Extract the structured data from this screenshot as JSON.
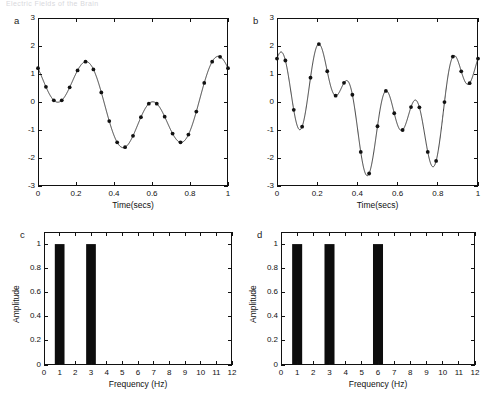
{
  "running_head": "Electric Fields of the Brain",
  "figure": {
    "width": 496,
    "height": 415,
    "background": "#ffffff",
    "line_color": "#1a1a1a",
    "bar_color": "#0d0d0d",
    "axis_color": "#111111"
  },
  "panels": [
    {
      "id": "a",
      "letter": "a",
      "kind": "line",
      "xlabel": "Time(secs)",
      "ylabel": "",
      "xticks": [
        0,
        0.2,
        0.4,
        0.6,
        0.8,
        1
      ],
      "xtick_labels": [
        "0",
        "0.2",
        "0.4",
        "0.6",
        "0.8",
        "1"
      ],
      "yticks": [
        -3,
        -2,
        -1,
        0,
        1,
        2,
        3
      ],
      "ytick_labels": [
        "-3",
        "-2",
        "-1",
        "0",
        "1",
        "2",
        "3"
      ],
      "xlim": [
        0,
        1
      ],
      "ylim": [
        -3,
        3
      ],
      "markers_visible": true
    },
    {
      "id": "b",
      "letter": "b",
      "kind": "line",
      "xlabel": "Time(secs)",
      "ylabel": "",
      "xticks": [
        0,
        0.2,
        0.4,
        0.6,
        0.8,
        1
      ],
      "xtick_labels": [
        "0",
        "0.2",
        "0.4",
        "0.6",
        "0.8",
        "1"
      ],
      "yticks": [
        -3,
        -2,
        -1,
        0,
        1,
        2,
        3
      ],
      "ytick_labels": [
        "-3",
        "-2",
        "-1",
        "0",
        "1",
        "2",
        "3"
      ],
      "xlim": [
        0,
        1
      ],
      "ylim": [
        -3,
        3
      ],
      "markers_visible": true
    },
    {
      "id": "c",
      "letter": "c",
      "kind": "bar",
      "xlabel": "Frequency (Hz)",
      "ylabel": "Amplitude",
      "xticks": [
        0,
        1,
        2,
        3,
        4,
        5,
        6,
        7,
        8,
        9,
        10,
        11,
        12
      ],
      "xtick_labels": [
        "0",
        "1",
        "2",
        "3",
        "4",
        "5",
        "6",
        "7",
        "8",
        "9",
        "10",
        "11",
        "12"
      ],
      "yticks": [
        0,
        0.2,
        0.4,
        0.6,
        0.8,
        1
      ],
      "ytick_labels": [
        "0",
        "0.2",
        "0.4",
        "0.6",
        "0.8",
        "1"
      ],
      "xlim": [
        0,
        12
      ],
      "ylim": [
        0,
        1.1
      ]
    },
    {
      "id": "d",
      "letter": "d",
      "kind": "bar",
      "xlabel": "Frequency (Hz)",
      "ylabel": "Amplitude",
      "xticks": [
        0,
        1,
        2,
        3,
        4,
        5,
        6,
        7,
        8,
        9,
        10,
        11,
        12
      ],
      "xtick_labels": [
        "0",
        "1",
        "2",
        "3",
        "4",
        "5",
        "6",
        "7",
        "8",
        "9",
        "10",
        "11",
        "12"
      ],
      "yticks": [
        0,
        0.2,
        0.4,
        0.6,
        0.8,
        1
      ],
      "ytick_labels": [
        "0",
        "0.2",
        "0.4",
        "0.6",
        "0.8",
        "1"
      ],
      "xlim": [
        0,
        12
      ],
      "ylim": [
        0,
        1.1
      ]
    }
  ],
  "chart_data": [
    {
      "type": "line",
      "panel": "a",
      "title": "",
      "xlabel": "Time(secs)",
      "ylabel": "",
      "xlim": [
        0,
        1
      ],
      "ylim": [
        -3,
        3
      ],
      "grid": false,
      "legend": "none",
      "description": "Sum of two sinusoids: 1 Hz and 3 Hz, each unit amplitude, sampled at 24 Hz (markers)",
      "components": [
        {
          "frequency_hz": 1,
          "amplitude": 1,
          "phase_deg": 60
        },
        {
          "frequency_hz": 3,
          "amplitude": 1,
          "phase_deg": 160
        }
      ],
      "sample_rate_hz": 24,
      "marker_x": [
        0,
        0.0417,
        0.0833,
        0.125,
        0.1667,
        0.2083,
        0.25,
        0.2917,
        0.3333,
        0.375,
        0.4167,
        0.4583,
        0.5,
        0.5417,
        0.5833,
        0.625,
        0.6667,
        0.7083,
        0.75,
        0.7917,
        0.8333,
        0.875,
        0.9167,
        0.9583,
        1
      ]
    },
    {
      "type": "line",
      "panel": "b",
      "title": "",
      "xlabel": "Time(secs)",
      "ylabel": "",
      "xlim": [
        0,
        1
      ],
      "ylim": [
        -3,
        3
      ],
      "grid": false,
      "legend": "none",
      "description": "Sum of three sinusoids: 1 Hz, 3 Hz and 6 Hz of unit amplitude, sampled at 24 Hz (markers) — aliasing demonstration",
      "components": [
        {
          "frequency_hz": 1,
          "amplitude": 1,
          "phase_deg": 60
        },
        {
          "frequency_hz": 3,
          "amplitude": 1,
          "phase_deg": 160
        },
        {
          "frequency_hz": 6,
          "amplitude": 1,
          "phase_deg": 20
        }
      ],
      "sample_rate_hz": 24,
      "marker_x": [
        0,
        0.0417,
        0.0833,
        0.125,
        0.1667,
        0.2083,
        0.25,
        0.2917,
        0.3333,
        0.375,
        0.4167,
        0.4583,
        0.5,
        0.5417,
        0.5833,
        0.625,
        0.6667,
        0.7083,
        0.75,
        0.7917,
        0.8333,
        0.875,
        0.9167,
        0.9583,
        1
      ]
    },
    {
      "type": "bar",
      "panel": "c",
      "title": "",
      "xlabel": "Frequency (Hz)",
      "ylabel": "Amplitude",
      "categories": [
        1,
        3
      ],
      "values": [
        1,
        1
      ],
      "bar_width_hz": 0.62,
      "xlim": [
        0,
        12
      ],
      "ylim": [
        0,
        1.1
      ],
      "grid": false,
      "legend": "none"
    },
    {
      "type": "bar",
      "panel": "d",
      "title": "",
      "xlabel": "Frequency (Hz)",
      "ylabel": "Amplitude",
      "categories": [
        1,
        3,
        6
      ],
      "values": [
        1,
        1,
        1
      ],
      "bar_width_hz": 0.62,
      "xlim": [
        0,
        12
      ],
      "ylim": [
        0,
        1.1
      ],
      "grid": false,
      "legend": "none"
    }
  ]
}
